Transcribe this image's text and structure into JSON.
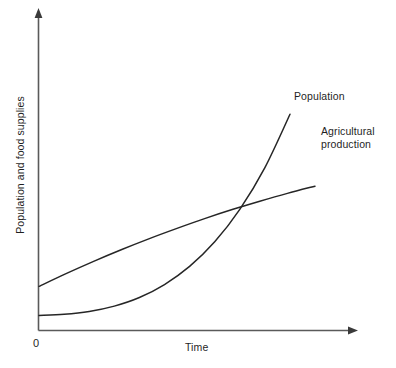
{
  "chart_data": {
    "type": "line",
    "title": "",
    "xlabel": "Time",
    "ylabel": "Population and food supplies",
    "origin_label": "0",
    "grid": false,
    "legend_position": "inline-end-of-curve",
    "axes": {
      "x_arrow": true,
      "y_arrow": true,
      "ticks": [],
      "xlim": [
        0,
        1
      ],
      "ylim": [
        0,
        1
      ]
    },
    "annotations": [
      {
        "name": "crossing-point",
        "text": "",
        "x": 0.73,
        "y": 0.53
      }
    ],
    "series": [
      {
        "name": "Population",
        "label": "Population",
        "shape": "exponential",
        "x": [
          0.0,
          0.1,
          0.2,
          0.3,
          0.4,
          0.5,
          0.6,
          0.7,
          0.8,
          0.9,
          1.0
        ],
        "y": [
          0.063,
          0.068,
          0.08,
          0.103,
          0.14,
          0.196,
          0.274,
          0.38,
          0.52,
          0.7,
          0.93
        ]
      },
      {
        "name": "Agricultural production",
        "label": "Agricultural\nproduction",
        "label_line_1": "Agricultural",
        "label_line_2": "production",
        "shape": "linear-slightly-concave",
        "x": [
          0.0,
          0.1,
          0.2,
          0.3,
          0.4,
          0.5,
          0.6,
          0.7,
          0.8,
          0.9,
          1.0
        ],
        "y": [
          0.188,
          0.244,
          0.297,
          0.347,
          0.394,
          0.438,
          0.48,
          0.519,
          0.555,
          0.589,
          0.62
        ]
      }
    ]
  },
  "colors": {
    "curve": "#262626",
    "axis": "#5a5a5a",
    "background": "#ffffff",
    "text": "#1f1f1f"
  }
}
